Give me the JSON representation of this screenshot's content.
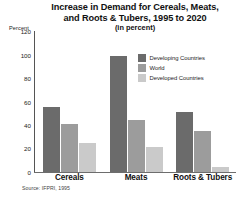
{
  "chart_data": {
    "type": "bar",
    "title": "Increase in Demand for Cereals, Meats, and Roots & Tubers, 1995 to 2020",
    "title_lines": [
      "Increase in Demand for Cereals, Meats,",
      "and Roots & Tubers, 1995 to 2020"
    ],
    "subtitle": "(in percent)",
    "xlabel": "",
    "ylabel": "Percent",
    "ylim": [
      0,
      120
    ],
    "yticks": [
      120,
      100,
      80,
      60,
      40,
      20,
      0
    ],
    "ytick_labels": [
      "120",
      "100",
      "80",
      "60",
      "40",
      "20",
      "0"
    ],
    "grid": false,
    "legend_position": "upper-right",
    "categories": [
      "Cereals",
      "Meats",
      "Roots & Tubers"
    ],
    "series": [
      {
        "name": "Developing Countries",
        "color": "#6b6b6b",
        "values": [
          55,
          99,
          51
        ]
      },
      {
        "name": "World",
        "color": "#9c9c9c",
        "values": [
          41,
          44,
          35
        ]
      },
      {
        "name": "Developed Countries",
        "color": "#cacaca",
        "values": [
          25,
          21,
          4
        ]
      }
    ],
    "source": "Source: IFPRI, 1995"
  }
}
